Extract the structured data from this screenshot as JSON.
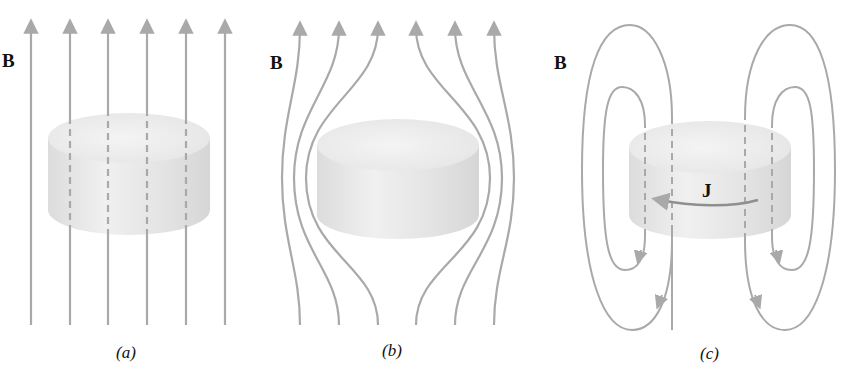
{
  "figure": {
    "panels": [
      {
        "id": "a",
        "caption": "(a)",
        "field_label": "B",
        "description": "Uniform vertical magnetic field lines passing straight through a cylinder"
      },
      {
        "id": "b",
        "caption": "(b)",
        "field_label": "B",
        "description": "Field lines bending around a cylinder, excluded from its interior"
      },
      {
        "id": "c",
        "caption": "(c)",
        "field_label": "B",
        "current_label": "J",
        "description": "Closed field loops around a cylinder carrying circulating surface current J"
      }
    ],
    "colors": {
      "field_line": "#a9a9a9",
      "cylinder_body": "#e6e6e6",
      "cylinder_top": "#efefef",
      "text": "#111111"
    }
  }
}
